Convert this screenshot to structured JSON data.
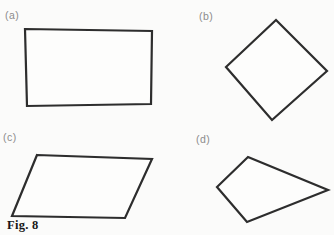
{
  "page": {
    "background": "#fbfbfa",
    "stroke_color": "#2d2d2d",
    "label_color": "#8c8c8c"
  },
  "top_text": {
    "fragment": "symmetry in the shapes of Fig. 8."
  },
  "figure": {
    "caption": "Fig. 8",
    "shapes": [
      {
        "label": "(a)",
        "kind": "rectangle",
        "points": "25,29 152,31 151,104 27,106"
      },
      {
        "label": "(b)",
        "kind": "rotated-square",
        "points": "276,20 327,71 272,120 226,67"
      },
      {
        "label": "(c)",
        "kind": "parallelogram",
        "points": "37,155 152,159 125,218 12,216"
      },
      {
        "label": "(d)",
        "kind": "kite-quadrilateral",
        "points": "248,157 328,190 247,222 217,187"
      }
    ]
  }
}
